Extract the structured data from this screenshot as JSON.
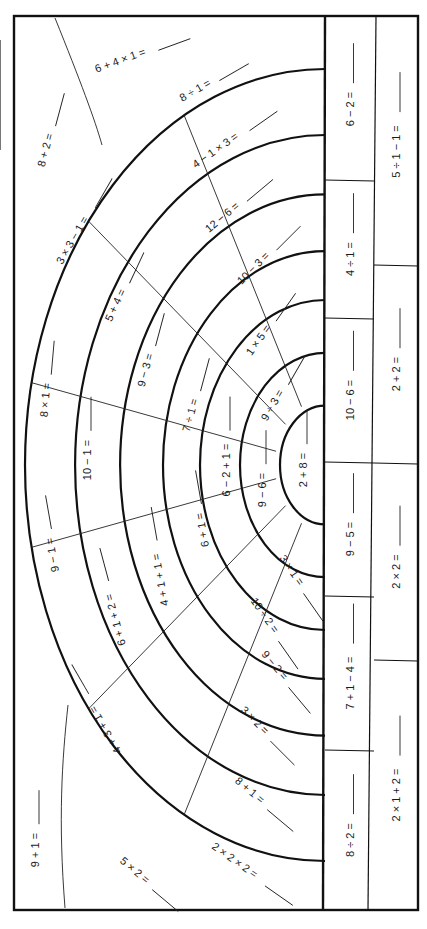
{
  "worksheet": {
    "orientation": "rotated-90",
    "ink_color": "#111111",
    "paper_color": "#ffffff",
    "answer_blank": "____"
  },
  "rainbow": {
    "center": [
      325,
      465
    ],
    "band_radii": [
      45,
      85,
      125,
      162,
      205,
      250,
      300
    ],
    "bands": [
      {
        "name": "core",
        "cells": [
          {
            "expr": "2 + 8 =",
            "x": 303,
            "y": 470,
            "rot": -90
          }
        ]
      },
      {
        "name": "ring-1",
        "cells": [
          {
            "expr": "9 ÷ 3 =",
            "x": 272,
            "y": 405,
            "rot": -60
          },
          {
            "expr": "9 − 6 =",
            "x": 262,
            "y": 490,
            "rot": -90
          },
          {
            "expr": "3 × 1 =",
            "x": 292,
            "y": 570,
            "rot": 55
          }
        ]
      },
      {
        "name": "ring-2",
        "cells": [
          {
            "expr": "1 × 5 =",
            "x": 258,
            "y": 340,
            "rot": -55
          },
          {
            "expr": "6 − 2 + 1 =",
            "x": 226,
            "y": 470,
            "rot": -90
          },
          {
            "expr": "10 ÷ 2 =",
            "x": 265,
            "y": 615,
            "rot": 55
          }
        ]
      },
      {
        "name": "ring-3",
        "cells": [
          {
            "expr": "10 − 3 =",
            "x": 253,
            "y": 268,
            "rot": -45
          },
          {
            "expr": "7 ÷ 1 =",
            "x": 190,
            "y": 415,
            "rot": -75
          },
          {
            "expr": "6 + 1 =",
            "x": 202,
            "y": 530,
            "rot": -100
          },
          {
            "expr": "9 − 2 =",
            "x": 275,
            "y": 665,
            "rot": 50
          }
        ]
      },
      {
        "name": "ring-4",
        "cells": [
          {
            "expr": "12 − 6 =",
            "x": 222,
            "y": 217,
            "rot": -40
          },
          {
            "expr": "9 − 3 =",
            "x": 145,
            "y": 370,
            "rot": -75
          },
          {
            "expr": "4 + 1 + 1 =",
            "x": 160,
            "y": 580,
            "rot": -100
          },
          {
            "expr": "3 × 2 =",
            "x": 255,
            "y": 720,
            "rot": 45
          }
        ]
      },
      {
        "name": "ring-5",
        "cells": [
          {
            "expr": "4 − 1 × 3 =",
            "x": 215,
            "y": 150,
            "rot": -35
          },
          {
            "expr": "5 + 4 =",
            "x": 115,
            "y": 305,
            "rot": -65
          },
          {
            "expr": "10 − 1 =",
            "x": 87,
            "y": 460,
            "rot": -90
          },
          {
            "expr": "6 + 1 + 2 =",
            "x": 115,
            "y": 620,
            "rot": -105
          },
          {
            "expr": "8 + 1 =",
            "x": 250,
            "y": 790,
            "rot": 40
          }
        ]
      },
      {
        "name": "ring-6",
        "cells": [
          {
            "expr": "8 ÷ 1 =",
            "x": 195,
            "y": 90,
            "rot": -30
          },
          {
            "expr": "3 × 3 − 1 =",
            "x": 72,
            "y": 240,
            "rot": -60
          },
          {
            "expr": "8 × 1 =",
            "x": 45,
            "y": 400,
            "rot": -85
          },
          {
            "expr": "9 − 1 =",
            "x": 52,
            "y": 555,
            "rot": -100
          },
          {
            "expr": "4 + 3 + 1 =",
            "x": 105,
            "y": 730,
            "rot": -120
          },
          {
            "expr": "2 × 2 × 2 =",
            "x": 235,
            "y": 860,
            "rot": 35
          }
        ]
      },
      {
        "name": "outer",
        "cells": [
          {
            "expr": "6 + 4 × 1 =",
            "x": 120,
            "y": 60,
            "rot": -20
          },
          {
            "expr": "8 + 2 =",
            "x": 45,
            "y": 150,
            "rot": -75
          },
          {
            "expr": "9 + 1 =",
            "x": 35,
            "y": 850,
            "rot": -90
          },
          {
            "expr": "5 × 2 =",
            "x": 135,
            "y": 870,
            "rot": 40
          }
        ]
      }
    ]
  },
  "right_columns": {
    "inner": [
      {
        "expr": "6 − 2 =",
        "y_top": 18,
        "y_bot": 180
      },
      {
        "expr": "4 ÷ 1 =",
        "y_top": 180,
        "y_bot": 318
      },
      {
        "expr": "10 − 6 =",
        "y_top": 318,
        "y_bot": 462
      },
      {
        "expr": "9 − 5 =",
        "y_top": 462,
        "y_bot": 596
      },
      {
        "expr": "7 + 1 − 4 =",
        "y_top": 596,
        "y_bot": 750
      },
      {
        "expr": "8 ÷ 2 =",
        "y_top": 750,
        "y_bot": 910
      }
    ],
    "outer": [
      {
        "expr": "5 ÷ 1 − 1 =",
        "y_top": 18,
        "y_bot": 265
      },
      {
        "expr": "2 + 2 =",
        "y_top": 265,
        "y_bot": 463
      },
      {
        "expr": "2 × 2 =",
        "y_top": 463,
        "y_bot": 660
      },
      {
        "expr": "2 × 1 + 2 =",
        "y_top": 660,
        "y_bot": 910
      }
    ]
  }
}
